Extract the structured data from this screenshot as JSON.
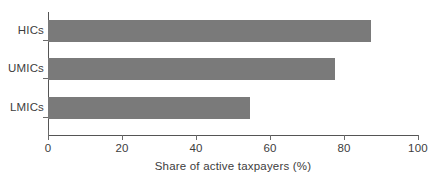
{
  "chart_data": {
    "type": "bar",
    "orientation": "horizontal",
    "title": "",
    "subtitle": "",
    "categories": [
      "HICs",
      "UMICs",
      "LMICs"
    ],
    "values": [
      87.4,
      77.6,
      54.5
    ],
    "series": [
      {
        "name": "Share of active taxpayers",
        "values": [
          87.4,
          77.6,
          54.5
        ]
      }
    ],
    "xlabel": "Share of active taxpayers (%)",
    "ylabel": "",
    "xlim": [
      0,
      100
    ],
    "xticks": [
      0,
      20,
      40,
      60,
      80,
      100
    ],
    "xtick_labels": [
      "0",
      "20",
      "40",
      "60",
      "80",
      "100"
    ],
    "ytick_labels": [
      "HICs",
      "UMICs",
      "LMICs"
    ],
    "grid": false,
    "legend": false,
    "legend_position": "none",
    "bar_color": "#7a7a7a",
    "axis_color": "#555555",
    "text_color": "#3d3d3d",
    "background": "#ffffff"
  }
}
